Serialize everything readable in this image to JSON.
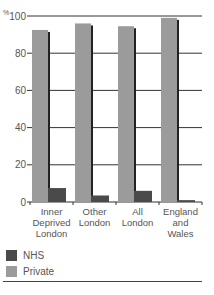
{
  "chart_data": {
    "type": "bar",
    "title": "",
    "xlabel": "",
    "ylabel": "%",
    "ylim": [
      0,
      100
    ],
    "yticks": [
      0,
      20,
      40,
      60,
      80,
      100
    ],
    "grid": true,
    "legend_position": "bottom-left",
    "categories": [
      "Inner Deprived London",
      "Other London",
      "All London",
      "England and Wales"
    ],
    "category_lines": [
      [
        "Inner",
        "Deprived",
        "London"
      ],
      [
        "Other",
        "London"
      ],
      [
        "All",
        "London"
      ],
      [
        "England",
        "and",
        "Wales"
      ]
    ],
    "series": [
      {
        "name": "Private",
        "color": "#9b9b9b",
        "values": [
          92.5,
          96,
          94.5,
          99
        ]
      },
      {
        "name": "NHS",
        "color": "#4a4a4a",
        "values": [
          7.5,
          3.5,
          6,
          1
        ]
      }
    ]
  },
  "legend": {
    "items": [
      {
        "label": "NHS",
        "color": "#4a4a4a"
      },
      {
        "label": "Private",
        "color": "#9b9b9b"
      }
    ]
  },
  "axis": {
    "unit_label": "%"
  }
}
